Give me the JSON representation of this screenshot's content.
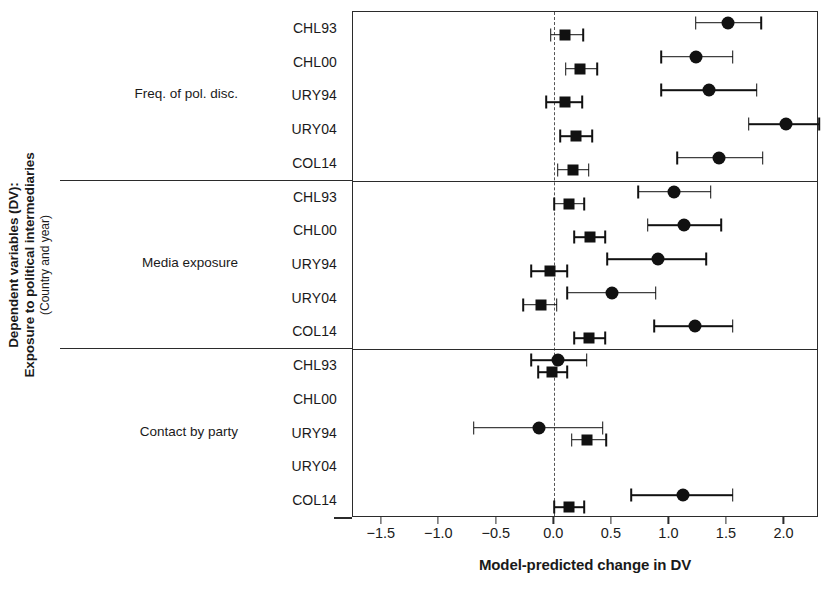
{
  "axis_titles": {
    "y_line1": "Dependent variables (DV):",
    "y_line2": "Exposure to political intermediaries",
    "y_line3": "(Country and year)",
    "x": "Model-predicted change in DV"
  },
  "caption_fragment": "",
  "chart_data": {
    "type": "scatter",
    "title": "",
    "xlabel": "Model-predicted change in DV",
    "ylabel": "Dependent variables (DV): Exposure to political intermediaries (Country and year)",
    "xlim": [
      -1.75,
      2.3
    ],
    "xticks": [
      -1.5,
      -1.0,
      -0.5,
      0.0,
      0.5,
      1.0,
      1.5,
      2.0
    ],
    "xticklabels": [
      "-1.5",
      "-1.0",
      "-0.5",
      "0.0",
      "0.5",
      "1.0",
      "1.5",
      "2.0"
    ],
    "grid": false,
    "legend": "none",
    "zero_reference_line": 0.0,
    "groups": [
      {
        "label": "Freq. of pol. disc.",
        "rows": [
          {
            "label": "CHL93",
            "series": [
              {
                "name": "square",
                "marker": "square",
                "value": 0.09,
                "lo": -0.03,
                "hi": 0.25
              },
              {
                "name": "circle",
                "marker": "circle",
                "value": 1.51,
                "lo": 1.23,
                "hi": 1.8
              }
            ]
          },
          {
            "label": "CHL00",
            "series": [
              {
                "name": "square",
                "marker": "square",
                "value": 0.22,
                "lo": 0.1,
                "hi": 0.37
              },
              {
                "name": "circle",
                "marker": "circle",
                "value": 1.23,
                "lo": 0.93,
                "hi": 1.55
              }
            ]
          },
          {
            "label": "URY94",
            "series": [
              {
                "name": "square",
                "marker": "square",
                "value": 0.09,
                "lo": -0.07,
                "hi": 0.24
              },
              {
                "name": "circle",
                "marker": "circle",
                "value": 1.34,
                "lo": 0.93,
                "hi": 1.76
              }
            ]
          },
          {
            "label": "URY04",
            "series": [
              {
                "name": "square",
                "marker": "square",
                "value": 0.19,
                "lo": 0.05,
                "hi": 0.33
              },
              {
                "name": "circle",
                "marker": "circle",
                "value": 2.01,
                "lo": 1.69,
                "hi": 2.3
              }
            ]
          },
          {
            "label": "COL14",
            "series": [
              {
                "name": "square",
                "marker": "square",
                "value": 0.16,
                "lo": 0.03,
                "hi": 0.3
              },
              {
                "name": "circle",
                "marker": "circle",
                "value": 1.43,
                "lo": 1.07,
                "hi": 1.81
              }
            ]
          }
        ]
      },
      {
        "label": "Media exposure",
        "rows": [
          {
            "label": "CHL93",
            "series": [
              {
                "name": "square",
                "marker": "square",
                "value": 0.13,
                "lo": 0.0,
                "hi": 0.26
              },
              {
                "name": "circle",
                "marker": "circle",
                "value": 1.04,
                "lo": 0.73,
                "hi": 1.36
              }
            ]
          },
          {
            "label": "CHL00",
            "series": [
              {
                "name": "square",
                "marker": "square",
                "value": 0.31,
                "lo": 0.17,
                "hi": 0.44
              },
              {
                "name": "circle",
                "marker": "circle",
                "value": 1.13,
                "lo": 0.81,
                "hi": 1.45
              }
            ]
          },
          {
            "label": "URY94",
            "series": [
              {
                "name": "square",
                "marker": "square",
                "value": -0.04,
                "lo": -0.2,
                "hi": 0.11
              },
              {
                "name": "circle",
                "marker": "circle",
                "value": 0.9,
                "lo": 0.46,
                "hi": 1.32
              }
            ]
          },
          {
            "label": "URY04",
            "series": [
              {
                "name": "square",
                "marker": "square",
                "value": -0.12,
                "lo": -0.27,
                "hi": 0.02
              },
              {
                "name": "circle",
                "marker": "circle",
                "value": 0.5,
                "lo": 0.11,
                "hi": 0.88
              }
            ]
          },
          {
            "label": "COL14",
            "series": [
              {
                "name": "square",
                "marker": "square",
                "value": 0.3,
                "lo": 0.17,
                "hi": 0.44
              },
              {
                "name": "circle",
                "marker": "circle",
                "value": 1.22,
                "lo": 0.87,
                "hi": 1.55
              }
            ]
          }
        ]
      },
      {
        "label": "Contact by party",
        "rows": [
          {
            "label": "CHL93",
            "series": [
              {
                "name": "square",
                "marker": "square",
                "value": -0.02,
                "lo": -0.14,
                "hi": 0.11
              },
              {
                "name": "circle",
                "marker": "circle",
                "value": 0.03,
                "lo": -0.2,
                "hi": 0.28
              }
            ]
          },
          {
            "label": "CHL00",
            "series": []
          },
          {
            "label": "URY94",
            "series": [
              {
                "name": "square",
                "marker": "square",
                "value": 0.28,
                "lo": 0.15,
                "hi": 0.45
              },
              {
                "name": "circle",
                "marker": "circle",
                "value": -0.13,
                "lo": -0.7,
                "hi": 0.42
              }
            ]
          },
          {
            "label": "URY04",
            "series": []
          },
          {
            "label": "COL14",
            "series": [
              {
                "name": "square",
                "marker": "square",
                "value": 0.13,
                "lo": 0.0,
                "hi": 0.26
              },
              {
                "name": "circle",
                "marker": "circle",
                "value": 1.12,
                "lo": 0.67,
                "hi": 1.55
              }
            ]
          }
        ]
      }
    ]
  },
  "colors": {
    "marker": "#111111",
    "axis": "#2b2b2b",
    "zero_line": "#555555",
    "background": "#ffffff"
  }
}
